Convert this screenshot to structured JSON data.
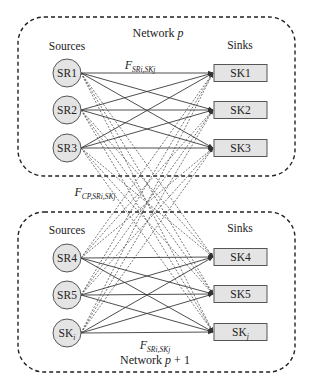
{
  "colors": {
    "background": "#ffffff",
    "node_fill": "#e4e4e4",
    "node_stroke": "#555555",
    "line": "#3a3a3a",
    "dashed_line": "#555555",
    "border": "#222222"
  },
  "networks": [
    {
      "id": "network-p",
      "title_main": "Network ",
      "title_var": "p",
      "title_suffix": "",
      "sources_label": "Sources",
      "sinks_label": "Sinks",
      "flow_label": {
        "main": "F",
        "sub": "SRi,SKj"
      },
      "sources": [
        {
          "label": "SR1",
          "sub": ""
        },
        {
          "label": "SR2",
          "sub": ""
        },
        {
          "label": "SR3",
          "sub": ""
        }
      ],
      "sinks": [
        {
          "label": "SK1",
          "sub": ""
        },
        {
          "label": "SK2",
          "sub": ""
        },
        {
          "label": "SK3",
          "sub": ""
        }
      ]
    },
    {
      "id": "network-p-plus-1",
      "title_main": "Network ",
      "title_var": "p",
      "title_suffix": " + 1",
      "sources_label": "Sources",
      "sinks_label": "Sinks",
      "flow_label": {
        "main": "F",
        "sub": "SRi,SKj"
      },
      "sources": [
        {
          "label": "SR4",
          "sub": ""
        },
        {
          "label": "SR5",
          "sub": ""
        },
        {
          "label": "SK",
          "sub": "i"
        }
      ],
      "sinks": [
        {
          "label": "SK4",
          "sub": ""
        },
        {
          "label": "SK5",
          "sub": ""
        },
        {
          "label": "SK",
          "sub": "j"
        }
      ]
    }
  ],
  "cross_flow_label": {
    "main": "F",
    "sub": "CP,SRi,SKj"
  }
}
